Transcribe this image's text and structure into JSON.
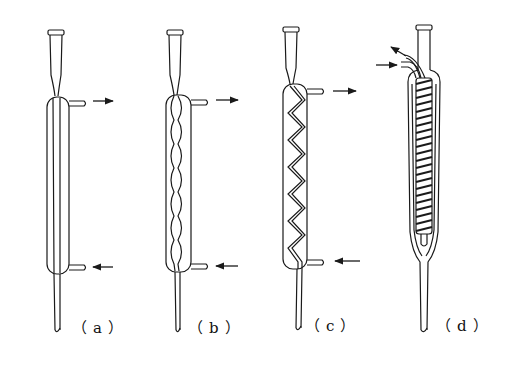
{
  "figure": {
    "type": "condenser-comparison",
    "colors": {
      "ink": "#1a1a1a",
      "background": "#ffffff"
    },
    "panels": [
      {
        "id": "a",
        "label": "（a）",
        "caption_text": "(a)",
        "kind": "straight-condenser",
        "flow": {
          "in": "bottom-side",
          "out": "top-side"
        }
      },
      {
        "id": "b",
        "label": "（b）",
        "caption_text": "(b)",
        "kind": "bulb-condenser",
        "flow": {
          "in": "bottom-side",
          "out": "top-side"
        }
      },
      {
        "id": "c",
        "label": "（c）",
        "caption_text": "(c)",
        "kind": "spiral-inner-tube-condenser",
        "flow": {
          "in": "bottom-side",
          "out": "top-side"
        }
      },
      {
        "id": "d",
        "label": "（d）",
        "caption_text": "(d)",
        "kind": "coil-condenser",
        "flow": {
          "in": "top-left-lower-port",
          "out": "top-left-upper-port"
        }
      }
    ]
  }
}
